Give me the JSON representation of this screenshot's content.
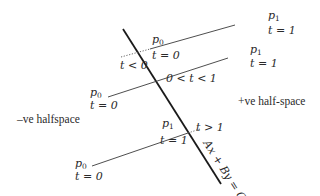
{
  "diagram": {
    "boundary": {
      "equation": "Ax + By = C",
      "stroke": "#1a1a1a"
    },
    "regions": {
      "negative": "–ve halfspace",
      "positive": "+ve half-space"
    },
    "segments": [
      {
        "id": "upper",
        "p0_label": "p",
        "p0_sub": "0",
        "p0_t": "t = 0",
        "p1_label": "p",
        "p1_sub": "1",
        "p1_t": "t = 1",
        "intersection_label": "t < 0"
      },
      {
        "id": "middle",
        "p0_label": "p",
        "p0_sub": "0",
        "p0_t": "t = 0",
        "p1_label": "p",
        "p1_sub": "1",
        "p1_t": "t = 1",
        "intersection_label": "0 < t < 1"
      },
      {
        "id": "lower",
        "p0_label": "p",
        "p0_sub": "0",
        "p0_t": "t = 0",
        "p1_label": "p",
        "p1_sub": "1",
        "p1_t": "t = 1",
        "intersection_label": "t > 1"
      }
    ]
  }
}
